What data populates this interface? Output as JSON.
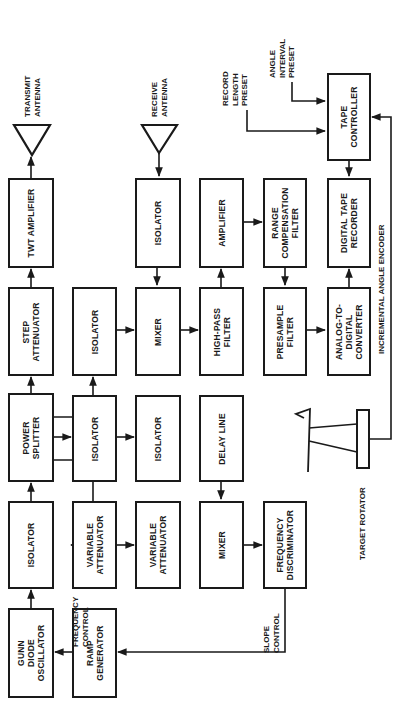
{
  "diagram": {
    "orientation": "rotated 90 degrees counter-clockwise",
    "line_color": "#1a1a1a",
    "blocks": {
      "twt_amplifier": "TWT AMPLIFIER",
      "step_attenuator": "STEP\nATTENUATOR",
      "power_splitter": "POWER\nSPLITTER",
      "isolator_tx": "ISOLATOR",
      "gunn_oscillator": "GUNN\nDIODE\nOSCILLATOR",
      "isolator_a": "ISOLATOR",
      "isolator_b": "ISOLATOR",
      "variable_attenuator": "VARIABLE\nATTENUATOR",
      "ramp_generator": "RAMP\nGENERATOR",
      "isolator_rx": "ISOLATOR",
      "mixer_rx": "MIXER",
      "delay_line": "DELAY LINE",
      "mixer_ref": "MIXER",
      "amplifier": "AMPLIFIER",
      "high_pass_filter": "HIGH-PASS\nFILTER",
      "frequency_discriminator": "FREQUENCY\nDISCRIMINATOR",
      "range_compensation_filter": "RANGE\nCOMPENSATION\nFILTER",
      "presample_filter": "PRESAMPLE\nFILTER",
      "tape_controller": "TAPE\nCONTROLLER",
      "digital_tape_recorder": "DIGITAL TAPE\nRECORDER",
      "adc": "ANALOG-TO-\nDIGITAL\nCONVERTER"
    },
    "labels": {
      "transmit_antenna": "TRANSMIT\nANTENNA",
      "receive_antenna": "RECEIVE\nANTENNA",
      "record_length_preset": "RECORD\nLENGTH\nPRESET",
      "angle_interval_preset": "ANGLE\nINTERVAL\nPRESET",
      "frequency_control": "FREQUENCY\nCONTROL",
      "slope_control": "SLOPE\nCONTROL",
      "incremental_angle_encoder": "INCREMENTAL ANGLE ENCODER",
      "target_rotator": "TARGET ROTATOR"
    },
    "connections": [
      {
        "from": "GUNN DIODE OSCILLATOR",
        "to": "ISOLATOR"
      },
      {
        "from": "ISOLATOR",
        "to": "POWER SPLITTER"
      },
      {
        "from": "POWER SPLITTER",
        "to": "STEP ATTENUATOR"
      },
      {
        "from": "STEP ATTENUATOR",
        "to": "TWT AMPLIFIER"
      },
      {
        "from": "TWT AMPLIFIER",
        "to": "TRANSMIT ANTENNA"
      },
      {
        "from": "POWER SPLITTER",
        "to": "ISOLATOR (upper)"
      },
      {
        "from": "POWER SPLITTER",
        "to": "ISOLATOR (middle)"
      },
      {
        "from": "POWER SPLITTER",
        "to": "VARIABLE ATTENUATOR"
      },
      {
        "from": "ISOLATOR (upper)",
        "to": "MIXER"
      },
      {
        "from": "RECEIVE ANTENNA",
        "to": "ISOLATOR (rx)"
      },
      {
        "from": "ISOLATOR (rx)",
        "to": "MIXER"
      },
      {
        "from": "MIXER",
        "to": "HIGH-PASS FILTER"
      },
      {
        "from": "HIGH-PASS FILTER",
        "to": "AMPLIFIER"
      },
      {
        "from": "AMPLIFIER",
        "to": "RANGE COMPENSATION FILTER"
      },
      {
        "from": "RANGE COMPENSATION FILTER",
        "to": "PRESAMPLE FILTER"
      },
      {
        "from": "PRESAMPLE FILTER",
        "to": "ANALOG-TO-DIGITAL CONVERTER"
      },
      {
        "from": "ANALOG-TO-DIGITAL CONVERTER",
        "to": "DIGITAL TAPE RECORDER"
      },
      {
        "from": "TAPE CONTROLLER",
        "to": "DIGITAL TAPE RECORDER"
      },
      {
        "from": "RECORD LENGTH PRESET",
        "to": "TAPE CONTROLLER"
      },
      {
        "from": "ANGLE INTERVAL PRESET",
        "to": "TAPE CONTROLLER"
      },
      {
        "from": "TARGET ROTATOR",
        "to": "TAPE CONTROLLER",
        "label": "INCREMENTAL ANGLE ENCODER"
      },
      {
        "from": "ISOLATOR (middle)",
        "to": "DELAY LINE"
      },
      {
        "from": "DELAY LINE",
        "to": "MIXER (ref)"
      },
      {
        "from": "VARIABLE ATTENUATOR",
        "to": "MIXER (ref)"
      },
      {
        "from": "MIXER (ref)",
        "to": "FREQUENCY DISCRIMINATOR"
      },
      {
        "from": "FREQUENCY DISCRIMINATOR",
        "to": "RAMP GENERATOR",
        "label": "SLOPE CONTROL"
      },
      {
        "from": "RAMP GENERATOR",
        "to": "GUNN DIODE OSCILLATOR",
        "label": "FREQUENCY CONTROL"
      }
    ]
  }
}
